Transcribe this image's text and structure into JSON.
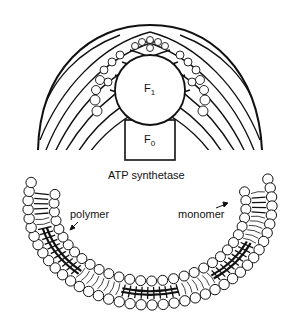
{
  "diagram": {
    "labels": {
      "f1_main": "F",
      "f1_sub": "1",
      "f0_main": "F",
      "f0_sub": "0",
      "protein": "ATP synthetase",
      "polymer": "polymer",
      "monomer": "monomer"
    },
    "colors": {
      "ink": "#111111",
      "background": "#ffffff"
    }
  }
}
